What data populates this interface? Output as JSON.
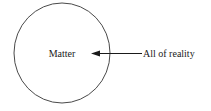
{
  "diagram": {
    "type": "venn-single-set",
    "background_color": "#ffffff",
    "circle": {
      "label": "Matter",
      "center_x": 62,
      "center_y": 53,
      "radius_x": 48,
      "radius_y": 50,
      "stroke_color": "#4a4a4a",
      "fill": "none"
    },
    "callout": {
      "label": "All of reality",
      "arrow_direction": "left",
      "arrow_tip_x": 91,
      "arrow_tip_y": 53,
      "line_start_x": 142,
      "line_end_x": 100,
      "line_y": 53,
      "color": "#1a1a1a"
    },
    "labels": {
      "inner_label": "Matter",
      "outer_label": "All of reality"
    }
  }
}
